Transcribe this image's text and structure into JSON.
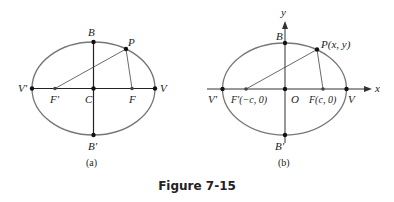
{
  "figure": {
    "caption": "Figure 7-15",
    "colors": {
      "ellipse": "#777777",
      "lines": "#222222",
      "points": "#111111"
    },
    "panels": [
      {
        "id": "a",
        "label": "(a)",
        "points": {
          "V_prime": "V'",
          "F_prime": "F'",
          "C": "C",
          "F": "F",
          "V": "V",
          "B": "B",
          "B_prime": "B'",
          "P": "P"
        }
      },
      {
        "id": "b",
        "label": "(b)",
        "axes": {
          "x": "x",
          "y": "y"
        },
        "points": {
          "V_prime": "V'",
          "F_prime": "F'(−c, 0)",
          "O": "O",
          "F": "F(c, 0)",
          "V": "V",
          "B": "B",
          "B_prime": "B'",
          "P": "P(x, y)"
        }
      }
    ]
  }
}
